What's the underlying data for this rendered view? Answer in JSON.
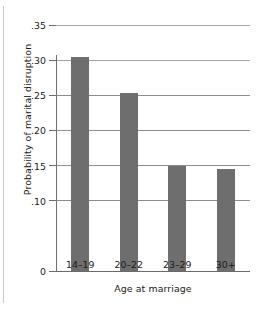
{
  "chart_data": {
    "type": "bar",
    "title": "",
    "xlabel": "Age at marriage",
    "ylabel": "Probability of marital disruption",
    "categories": [
      "14–19",
      "20–22",
      "23–29",
      "30+"
    ],
    "values": [
      0.305,
      0.253,
      0.15,
      0.145
    ],
    "ylim": [
      0,
      0.36
    ],
    "yticks": [
      0,
      0.1,
      0.15,
      0.2,
      0.25,
      0.3,
      0.35
    ],
    "ytick_labels": [
      "0",
      ".10",
      ".15",
      ".20",
      ".25",
      ".30",
      ".35"
    ],
    "grid": true,
    "legend": null,
    "bar_color": "#6e6e6e",
    "gridline_color": "#8d8d8d",
    "text_color": "#1b1b1b"
  }
}
